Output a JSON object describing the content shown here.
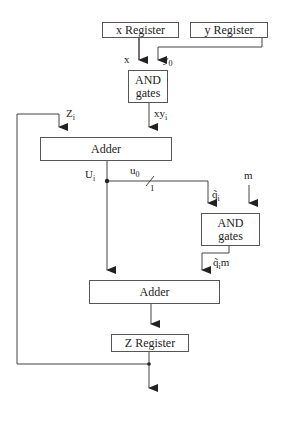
{
  "diagram": {
    "blocks": {
      "x_register": "x Register",
      "y_register": "y Register",
      "and_gates_1": [
        "AND",
        "gates"
      ],
      "adder_1": "Adder",
      "and_gates_2": [
        "AND",
        "gates"
      ],
      "adder_2": "Adder",
      "z_register": "Z Register"
    },
    "signals": {
      "x": "x",
      "y0_base": "y",
      "y0_sub": "0",
      "xy_base": "xy",
      "xy_sub": "i",
      "z_base": "Z",
      "z_sub": "i",
      "u_base": "U",
      "u_sub": "i",
      "u0_base": "u",
      "u0_sub": "0",
      "bus_width": "1",
      "q_base": "q̃",
      "q_sub": "i",
      "m": "m",
      "qm_base": "q̃",
      "qm_sub": "i",
      "qm_suffix": "m"
    },
    "colors": {
      "line": "#444444",
      "box_border": "#555555"
    }
  }
}
